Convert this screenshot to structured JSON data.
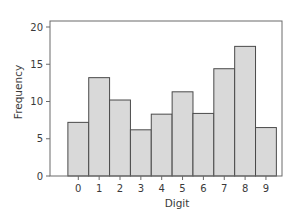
{
  "chart_data": {
    "type": "bar",
    "title": "",
    "xlabel": "Digit",
    "ylabel": "Frequency",
    "categories": [
      "0",
      "1",
      "2",
      "3",
      "4",
      "5",
      "6",
      "7",
      "8",
      "9"
    ],
    "values": [
      7.2,
      13.2,
      10.2,
      6.2,
      8.3,
      11.3,
      8.4,
      14.4,
      17.4,
      6.5
    ],
    "ylim": [
      0,
      21
    ],
    "yticks": [
      0,
      5,
      10,
      15,
      20
    ],
    "grid": false,
    "legend": null,
    "bar_style": "histogram (adjacent bars, no gaps)",
    "colors": {
      "bar_fill": "#d9d9d9",
      "bar_edge": "#4a4a4a",
      "axis": "#6a6a6a",
      "text": "#3a3a3a"
    }
  },
  "layout": {
    "plot_left": 50,
    "plot_right": 282,
    "plot_top": 21,
    "plot_bottom": 176,
    "first_bar_center": 78.3,
    "bar_width": 20.85,
    "px_per_unit": 7.45
  }
}
